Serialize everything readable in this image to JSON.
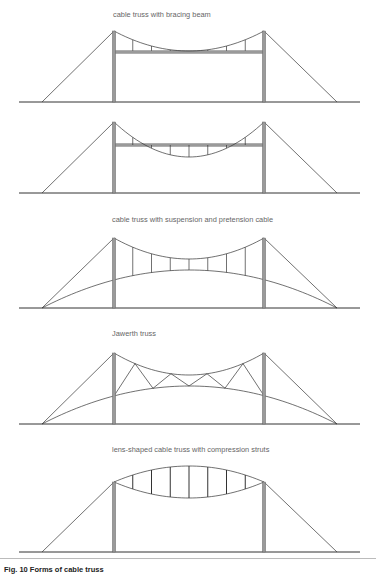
{
  "labels": {
    "d1": "cable truss with bracing beam",
    "d3": "cable truss with suspension and pretension cable",
    "d4": "Jawerth truss",
    "d5": "lens-shaped cable truss with compression struts"
  },
  "caption": "Fig. 10 Forms of cable truss",
  "colors": {
    "line": "#333333",
    "tower_fill": "#9a9a9a",
    "tower_edge": "#555555",
    "text": "#666666"
  },
  "geometry": {
    "ground_x": [
      19,
      360
    ],
    "anchor_x": [
      42,
      337
    ],
    "tower_x": [
      114,
      264
    ],
    "diagrams": [
      {
        "id": "d1",
        "ground_y": 102,
        "top_y": 31,
        "deck_y": 52,
        "sag_y": 51
      },
      {
        "id": "d2",
        "ground_y": 193,
        "top_y": 122,
        "deck_y": 145,
        "sag_y": 157
      },
      {
        "id": "d3",
        "ground_y": 308,
        "top_y": 238,
        "lower_mid_y": 270,
        "upper_mid_y": 259
      },
      {
        "id": "d4",
        "ground_y": 424,
        "top_y": 353,
        "lower_mid_y": 386,
        "upper_mid_y": 375
      },
      {
        "id": "d5",
        "ground_y": 552,
        "top_y": 482,
        "upper_mid_y": 466,
        "lower_mid_y": 498
      }
    ]
  }
}
